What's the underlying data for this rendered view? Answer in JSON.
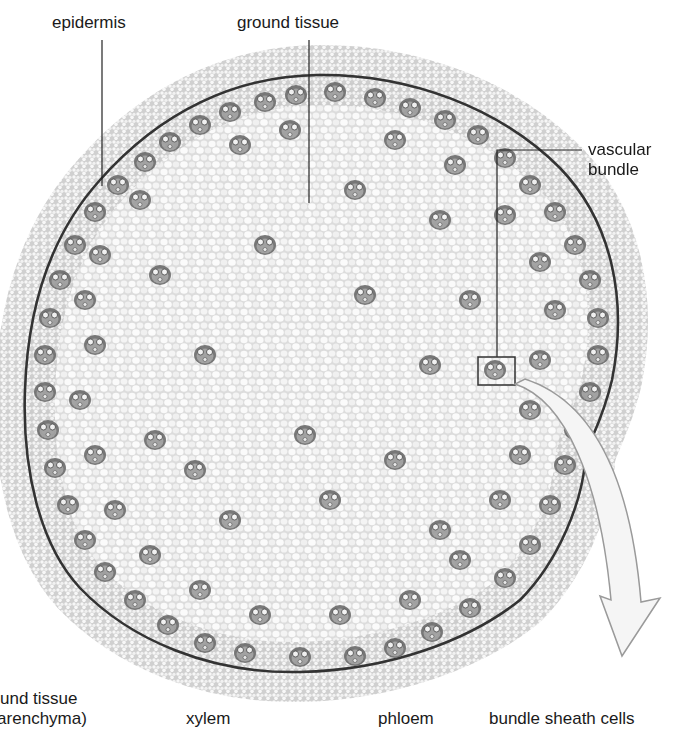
{
  "figure": {
    "colors": {
      "background": "#ffffff",
      "tissue_fill": "#e9e9e9",
      "cell_wall": "#b8b8b8",
      "bundle_fill": "#8a8a8a",
      "bundle_dark": "#4a4a4a",
      "epidermis_edge": "#3a3a3a",
      "leader_line": "#222222",
      "arrow_stroke": "#9a9a9a",
      "arrow_fill": "#f4f4f4"
    }
  },
  "labels": {
    "top": [
      {
        "id": "epidermis",
        "text": "epidermis"
      },
      {
        "id": "ground-tissue",
        "text": "ground tissue"
      }
    ],
    "right": {
      "line1": "vascular",
      "line2": "bundle"
    },
    "bottom": [
      {
        "id": "ground-tissue-parenchyma",
        "line1": "und tissue",
        "line2": "(parenchyma)"
      },
      {
        "id": "xylem",
        "text": "xylem"
      },
      {
        "id": "phloem",
        "text": "phloem"
      },
      {
        "id": "bundle-sheath-cells",
        "text": "bundle sheath cells"
      }
    ]
  }
}
